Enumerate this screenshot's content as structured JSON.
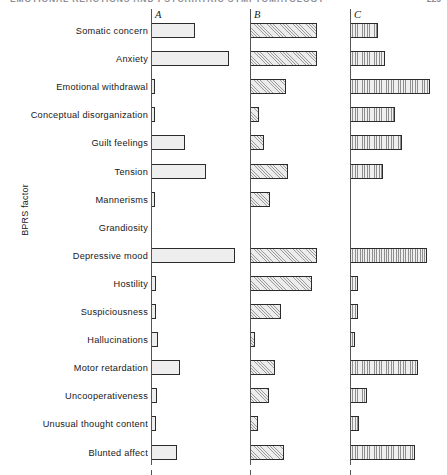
{
  "page": {
    "running_head": "EMOTIONAL REACTIONS AND PSYCHIATRIC SYMPTOMATOLOGY",
    "page_number": "225"
  },
  "chart_data": {
    "type": "bar",
    "orientation": "horizontal",
    "title": "",
    "xlabel": "",
    "ylabel": "BPRS factor",
    "grid": false,
    "legend_position": "panel-letters-above-axes",
    "panels": [
      "A",
      "B",
      "C"
    ],
    "categories": [
      "Somatic concern",
      "Anxiety",
      "Emotional withdrawal",
      "Conceptual disorganization",
      "Guilt feelings",
      "Tension",
      "Mannerisms",
      "Grandiosity",
      "Depressive mood",
      "Hostility",
      "Suspiciousness",
      "Hallucinations",
      "Motor retardation",
      "Uncooperativeness",
      "Unusual thought content",
      "Blunted affect"
    ],
    "series": [
      {
        "name": "A",
        "fill": "stipple",
        "axis_x": 151,
        "values": [
          44,
          78,
          4,
          4,
          34,
          55,
          4,
          0,
          84,
          5,
          5,
          7,
          29,
          6,
          5,
          26
        ]
      },
      {
        "name": "B",
        "fill": "diagonal-hatch",
        "axis_x": 250,
        "values": [
          67,
          67,
          36,
          9,
          14,
          38,
          20,
          0,
          67,
          62,
          31,
          5,
          25,
          19,
          8,
          34
        ]
      },
      {
        "name": "C",
        "fill": "vertical-hatch",
        "axis_x": 350,
        "values": [
          28,
          35,
          80,
          45,
          52,
          33,
          0,
          0,
          77,
          8,
          8,
          5,
          68,
          17,
          9,
          65
        ]
      }
    ],
    "bar_pitch_px": 28.1,
    "bar_height_px": 15
  }
}
